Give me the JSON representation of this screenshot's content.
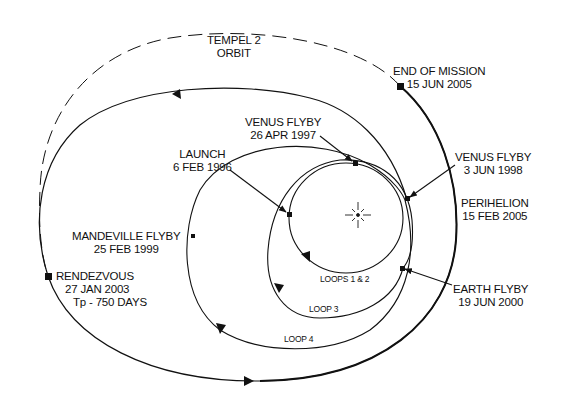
{
  "diagram": {
    "colors": {
      "line": "#111111",
      "background": "#ffffff"
    },
    "center_body": {
      "name": "sun-icon"
    },
    "orbits": {
      "tempel2": {
        "line1": "TEMPEL 2",
        "line2": "ORBIT",
        "style": "dashed"
      },
      "loops_1_2": {
        "label": "LOOPS 1 & 2"
      },
      "loop_3": {
        "label": "LOOP 3"
      },
      "loop_4": {
        "label": "LOOP 4"
      }
    },
    "events": {
      "end_of_mission": {
        "title": "END OF MISSION",
        "date": "15 JUN 2005"
      },
      "venus_flyby_1": {
        "title": "VENUS FLYBY",
        "date": "26 APR 1997"
      },
      "launch": {
        "title": "LAUNCH",
        "date": "6 FEB 1996"
      },
      "venus_flyby_2": {
        "title": "VENUS FLYBY",
        "date": "3 JUN 1998"
      },
      "perihelion": {
        "title": "PERIHELION",
        "date": "15 FEB 2005"
      },
      "mandeville_flyby": {
        "title": "MANDEVILLE FLYBY",
        "date": "25 FEB 1999"
      },
      "earth_flyby": {
        "title": "EARTH FLYBY",
        "date": "19 JUN 2000"
      },
      "rendezvous": {
        "title": "RENDEZVOUS",
        "date": "27 JAN 2003",
        "note": "Tp - 750  DAYS"
      }
    }
  }
}
